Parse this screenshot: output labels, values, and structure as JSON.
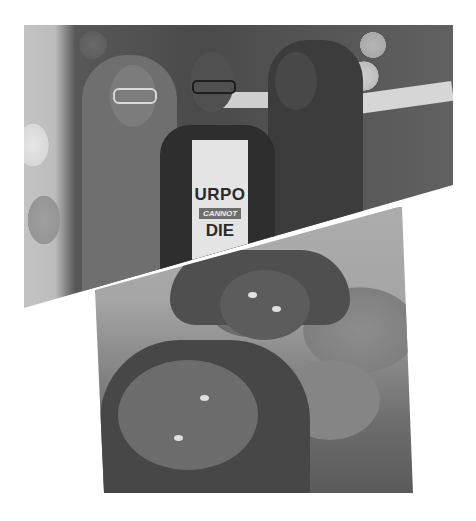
{
  "collage": {
    "description": "Grayscale two-photo collage separated by a diagonal white gap",
    "top_photo": {
      "subject": "Three women posing at a party in front of a streamer curtain with balloons and a banner",
      "shirt_text": {
        "line1": "URPO",
        "line2": "CANNOT",
        "line3": "DIE"
      }
    },
    "bottom_photo": {
      "subject": "Two women with braided hair lying close together, smiling selfie"
    },
    "colors": {
      "background": "#ffffff",
      "tone_light": "#d6d6d6",
      "tone_mid": "#6f6f6f",
      "tone_dark": "#2e2e2e"
    }
  }
}
